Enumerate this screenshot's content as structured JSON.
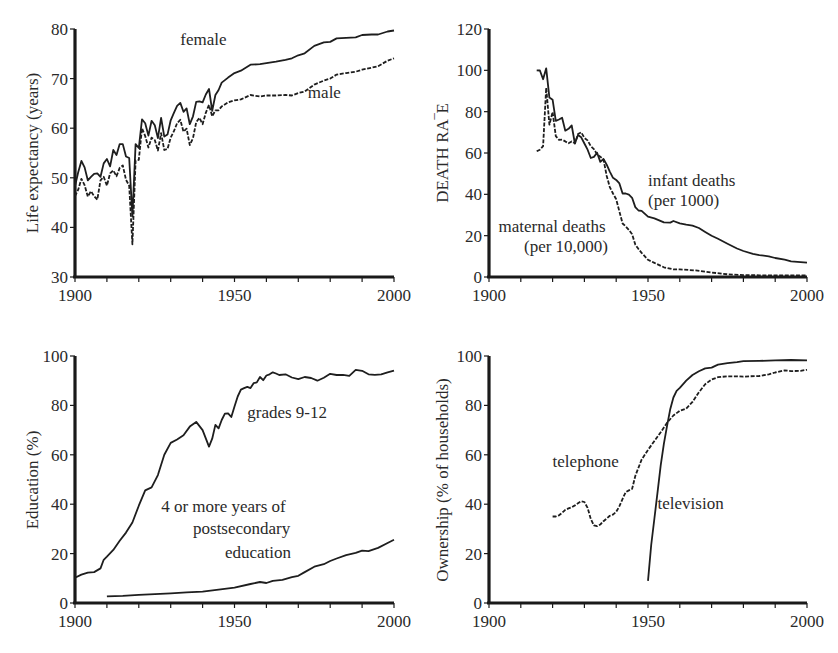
{
  "chart_data": [
    {
      "id": "life",
      "type": "line",
      "title": "",
      "xlabel": "",
      "ylabel": "Life expectancy (years)",
      "xlim": [
        1900,
        2000
      ],
      "ylim": [
        30,
        80
      ],
      "xticks": [
        1900,
        1950,
        2000
      ],
      "yticks": [
        30,
        40,
        50,
        60,
        70,
        80
      ],
      "grid": false,
      "legend": "inline annotations",
      "series": [
        {
          "name": "female",
          "style": "solid",
          "x": [
            1900,
            1901,
            1902,
            1903,
            1904,
            1905,
            1906,
            1907,
            1908,
            1909,
            1910,
            1911,
            1912,
            1913,
            1914,
            1915,
            1916,
            1917,
            1918,
            1919,
            1920,
            1921,
            1922,
            1923,
            1924,
            1925,
            1926,
            1927,
            1928,
            1929,
            1930,
            1931,
            1932,
            1933,
            1934,
            1935,
            1936,
            1937,
            1938,
            1939,
            1940,
            1941,
            1942,
            1943,
            1944,
            1945,
            1946,
            1947,
            1948,
            1950,
            1952,
            1955,
            1958,
            1960,
            1963,
            1966,
            1968,
            1970,
            1972,
            1975,
            1978,
            1980,
            1982,
            1985,
            1988,
            1990,
            1993,
            1995,
            1998,
            2000
          ],
          "y": [
            48.3,
            51.1,
            53.4,
            52.1,
            49.5,
            50.2,
            50.8,
            50.9,
            50.2,
            52.9,
            53.8,
            52.3,
            55.6,
            54.6,
            56.8,
            56.8,
            54.3,
            54.0,
            42.2,
            56.8,
            56.0,
            61.8,
            61.0,
            58.5,
            61.5,
            60.6,
            58.0,
            62.1,
            58.3,
            58.7,
            61.6,
            63.1,
            64.5,
            65.1,
            63.3,
            64.0,
            60.8,
            62.4,
            65.3,
            65.4,
            65.2,
            66.8,
            67.9,
            63.5,
            66.7,
            67.7,
            69.2,
            69.7,
            70.2,
            71.1,
            71.6,
            72.8,
            72.9,
            73.1,
            73.4,
            73.8,
            74.1,
            74.7,
            75.1,
            76.6,
            77.3,
            77.4,
            78.1,
            78.2,
            78.3,
            78.8,
            78.9,
            78.9,
            79.5,
            79.7
          ]
        },
        {
          "name": "male",
          "style": "dashed",
          "x": [
            1900,
            1901,
            1902,
            1903,
            1904,
            1905,
            1906,
            1907,
            1908,
            1909,
            1910,
            1911,
            1912,
            1913,
            1914,
            1915,
            1916,
            1917,
            1918,
            1919,
            1920,
            1921,
            1922,
            1923,
            1924,
            1925,
            1926,
            1927,
            1928,
            1929,
            1930,
            1931,
            1932,
            1933,
            1934,
            1935,
            1936,
            1937,
            1938,
            1939,
            1940,
            1941,
            1942,
            1943,
            1944,
            1945,
            1946,
            1948,
            1950,
            1952,
            1955,
            1958,
            1960,
            1963,
            1966,
            1968,
            1970,
            1972,
            1975,
            1978,
            1980,
            1982,
            1985,
            1988,
            1990,
            1993,
            1995,
            1998,
            2000
          ],
          "y": [
            46.3,
            47.6,
            49.8,
            48.5,
            46.2,
            47.3,
            46.3,
            45.6,
            49.5,
            50.2,
            48.4,
            50.9,
            51.5,
            50.3,
            52.0,
            52.5,
            49.6,
            48.4,
            36.6,
            53.5,
            53.6,
            60.0,
            58.4,
            56.1,
            58.1,
            57.6,
            55.5,
            59.0,
            55.6,
            55.8,
            58.1,
            59.4,
            61.0,
            61.7,
            59.3,
            59.9,
            56.6,
            58.0,
            61.2,
            62.1,
            60.8,
            63.1,
            64.7,
            62.4,
            63.6,
            63.6,
            64.4,
            65.2,
            65.6,
            65.8,
            66.7,
            66.4,
            66.6,
            66.6,
            66.7,
            66.6,
            67.1,
            67.4,
            68.8,
            69.6,
            70.0,
            70.8,
            71.1,
            71.4,
            71.8,
            72.2,
            72.5,
            73.6,
            74.1
          ]
        }
      ],
      "annotations": [
        {
          "text": "female",
          "x": 1933,
          "y": 76.8
        },
        {
          "text": "male",
          "x": 1973,
          "y": 66.0
        }
      ]
    },
    {
      "id": "death",
      "type": "line",
      "title": "",
      "xlabel": "",
      "ylabel": "DEATH RA‾E",
      "xlim": [
        1900,
        2000
      ],
      "ylim": [
        0,
        120
      ],
      "xticks": [
        1900,
        1950,
        2000
      ],
      "yticks": [
        0,
        20,
        40,
        60,
        80,
        100,
        120
      ],
      "grid": false,
      "legend": "inline annotations",
      "series": [
        {
          "name": "infant deaths (per 1000)",
          "style": "solid",
          "x": [
            1915,
            1916,
            1917,
            1918,
            1919,
            1920,
            1921,
            1922,
            1923,
            1924,
            1925,
            1926,
            1927,
            1928,
            1929,
            1930,
            1931,
            1932,
            1933,
            1934,
            1935,
            1936,
            1937,
            1938,
            1939,
            1940,
            1941,
            1942,
            1943,
            1944,
            1945,
            1946,
            1947,
            1948,
            1950,
            1952,
            1955,
            1957,
            1958,
            1960,
            1962,
            1964,
            1966,
            1968,
            1970,
            1972,
            1975,
            1978,
            1980,
            1983,
            1985,
            1988,
            1990,
            1993,
            1995,
            1998,
            2000
          ],
          "y": [
            100,
            99.9,
            95.7,
            101,
            86.8,
            85.8,
            75.6,
            76.2,
            77.1,
            70.8,
            71.7,
            73.3,
            64.6,
            68.7,
            67.6,
            64.6,
            61.6,
            57.6,
            58.1,
            60.1,
            55.7,
            57.1,
            54.4,
            51.0,
            48.0,
            47.0,
            45.3,
            40.4,
            40.4,
            39.8,
            38.3,
            33.8,
            32.2,
            32.0,
            29.2,
            28.4,
            26.4,
            26.3,
            27.1,
            26.0,
            25.3,
            24.8,
            23.7,
            21.8,
            20.0,
            18.5,
            16.1,
            13.8,
            12.6,
            11.2,
            10.6,
            10.0,
            9.2,
            8.4,
            7.6,
            7.2,
            6.9
          ]
        },
        {
          "name": "maternal deaths (per 10,000)",
          "style": "dashed",
          "x": [
            1915,
            1916,
            1917,
            1918,
            1919,
            1920,
            1921,
            1922,
            1923,
            1924,
            1925,
            1926,
            1927,
            1928,
            1929,
            1930,
            1931,
            1932,
            1933,
            1934,
            1935,
            1936,
            1937,
            1938,
            1939,
            1940,
            1941,
            1942,
            1943,
            1944,
            1945,
            1946,
            1947,
            1948,
            1950,
            1952,
            1955,
            1958,
            1960,
            1965,
            1970,
            1975,
            1980,
            1985,
            1990,
            1995,
            2000
          ],
          "y": [
            60.8,
            61.6,
            63.3,
            91.6,
            73.7,
            79.9,
            68.2,
            66.4,
            66.5,
            65.6,
            64.7,
            65.6,
            64.7,
            69.2,
            70.0,
            67.3,
            66.1,
            63.3,
            61.9,
            59.3,
            58.2,
            56.8,
            48.9,
            43.5,
            40.4,
            37.6,
            31.7,
            25.9,
            24.5,
            22.8,
            20.7,
            15.7,
            13.5,
            11.7,
            8.3,
            6.8,
            4.7,
            3.7,
            3.7,
            3.2,
            2.2,
            1.3,
            0.9,
            0.8,
            0.8,
            0.8,
            0.8
          ]
        }
      ],
      "annotations": [
        {
          "text": "infant deaths",
          "x": 1950,
          "y": 44.2
        },
        {
          "text": "(per 1000)",
          "x": 1950,
          "y": 34.4
        },
        {
          "text": "maternal deaths",
          "x": 1903,
          "y": 21.7
        },
        {
          "text": "(per 10,000)",
          "x": 1911,
          "y": 12.0
        }
      ]
    },
    {
      "id": "education",
      "type": "line",
      "title": "",
      "xlabel": "",
      "ylabel": "Education (%)",
      "xlim": [
        1900,
        2000
      ],
      "ylim": [
        0,
        100
      ],
      "xticks": [
        1900,
        1950,
        2000
      ],
      "yticks": [
        0,
        20,
        40,
        60,
        80,
        100
      ],
      "grid": false,
      "legend": "inline annotations",
      "series": [
        {
          "name": "grades 9-12",
          "style": "solid",
          "x": [
            1900,
            1902,
            1904,
            1906,
            1908,
            1909,
            1910,
            1912,
            1914,
            1916,
            1918,
            1920,
            1922,
            1924,
            1926,
            1928,
            1930,
            1932,
            1934,
            1936,
            1938,
            1940,
            1942,
            1943,
            1944,
            1945,
            1946,
            1947,
            1948,
            1949,
            1950,
            1951,
            1952,
            1953,
            1954,
            1955,
            1956,
            1957,
            1958,
            1959,
            1960,
            1961,
            1962,
            1963,
            1964,
            1966,
            1968,
            1970,
            1972,
            1974,
            1976,
            1978,
            1980,
            1982,
            1984,
            1986,
            1988,
            1990,
            1992,
            1994,
            1996,
            1998,
            2000
          ],
          "y": [
            10.2,
            11.5,
            12.3,
            12.5,
            14.0,
            17.5,
            18.8,
            21.5,
            25.2,
            28.5,
            32.6,
            39.4,
            45.6,
            46.8,
            51.8,
            60.0,
            64.8,
            66.2,
            67.9,
            71.4,
            73.3,
            70.0,
            63.3,
            66.5,
            72.1,
            70.7,
            74.1,
            76.7,
            76.8,
            75.3,
            79.5,
            83.6,
            86.4,
            87.0,
            87.5,
            87.0,
            89.0,
            89.3,
            91.5,
            90.2,
            92.1,
            92.6,
            93.4,
            92.9,
            92.3,
            92.6,
            91.3,
            90.6,
            91.5,
            91.1,
            90.0,
            91.2,
            92.8,
            92.3,
            92.4,
            92.0,
            94.4,
            94.0,
            92.6,
            92.4,
            92.6,
            93.4,
            94.1
          ]
        },
        {
          "name": "4 or more years of postsecondary education",
          "style": "solid",
          "x": [
            1910,
            1915,
            1920,
            1925,
            1930,
            1935,
            1940,
            1945,
            1950,
            1955,
            1958,
            1960,
            1962,
            1965,
            1968,
            1970,
            1972,
            1975,
            1978,
            1980,
            1982,
            1985,
            1988,
            1990,
            1992,
            1995,
            1998,
            2000
          ],
          "y": [
            2.7,
            2.9,
            3.3,
            3.6,
            3.9,
            4.3,
            4.6,
            5.4,
            6.2,
            7.7,
            8.5,
            8.1,
            9.0,
            9.4,
            10.5,
            11.0,
            12.5,
            14.7,
            15.7,
            17.0,
            18.0,
            19.4,
            20.3,
            21.2,
            21.0,
            22.3,
            24.3,
            25.6
          ]
        }
      ],
      "annotations": [
        {
          "text": "grades 9-12",
          "x": 1954,
          "y": 74.8
        },
        {
          "text": "4 or more years of",
          "x": 1927,
          "y": 36.8
        },
        {
          "text": "postsecondary",
          "x": 1937,
          "y": 27.9
        },
        {
          "text": "education",
          "x": 1947,
          "y": 18.4
        }
      ]
    },
    {
      "id": "ownership",
      "type": "line",
      "title": "",
      "xlabel": "",
      "ylabel": "Ownership (% of households)",
      "xlim": [
        1900,
        2000
      ],
      "ylim": [
        0,
        100
      ],
      "xticks": [
        1900,
        1950,
        2000
      ],
      "yticks": [
        0,
        20,
        40,
        60,
        80,
        100
      ],
      "grid": false,
      "legend": "inline annotations",
      "series": [
        {
          "name": "telephone",
          "style": "dashed",
          "x": [
            1920,
            1921,
            1922,
            1923,
            1924,
            1925,
            1926,
            1927,
            1928,
            1929,
            1930,
            1931,
            1932,
            1933,
            1934,
            1935,
            1936,
            1937,
            1938,
            1939,
            1940,
            1941,
            1942,
            1943,
            1944,
            1945,
            1946,
            1947,
            1948,
            1950,
            1952,
            1954,
            1956,
            1958,
            1960,
            1962,
            1964,
            1966,
            1968,
            1970,
            1972,
            1975,
            1978,
            1980,
            1982,
            1985,
            1988,
            1990,
            1993,
            1995,
            1998,
            2000
          ],
          "y": [
            35.0,
            35.0,
            35.5,
            36.5,
            37.7,
            38.3,
            38.8,
            39.5,
            40.4,
            41.2,
            40.9,
            38.5,
            34.0,
            31.4,
            31.1,
            31.8,
            33.1,
            34.2,
            35.3,
            35.8,
            36.9,
            39.2,
            42.2,
            44.9,
            45.6,
            46.2,
            51.4,
            54.8,
            58.0,
            62.0,
            65.6,
            69.1,
            73.0,
            75.9,
            77.8,
            78.7,
            81.4,
            85.3,
            88.6,
            90.5,
            91.4,
            91.8,
            91.8,
            91.6,
            91.8,
            91.9,
            92.6,
            93.3,
            94.2,
            93.9,
            94.0,
            94.4
          ]
        },
        {
          "name": "television",
          "style": "solid",
          "x": [
            1950,
            1951,
            1952,
            1953,
            1954,
            1955,
            1956,
            1957,
            1958,
            1959,
            1960,
            1962,
            1964,
            1966,
            1968,
            1970,
            1972,
            1975,
            1978,
            1980,
            1985,
            1990,
            1995,
            2000
          ],
          "y": [
            9.0,
            23.5,
            34.2,
            44.7,
            55.7,
            64.5,
            71.8,
            78.6,
            83.2,
            85.9,
            87.1,
            90.0,
            92.3,
            93.8,
            95.0,
            95.3,
            96.5,
            97.1,
            97.5,
            97.9,
            98.0,
            98.2,
            98.4,
            98.2
          ]
        }
      ],
      "annotations": [
        {
          "text": "telephone",
          "x": 1920,
          "y": 55.0
        },
        {
          "text": "television",
          "x": 1953,
          "y": 38.0
        }
      ]
    }
  ]
}
